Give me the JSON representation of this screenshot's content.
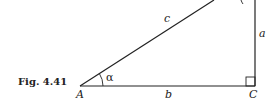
{
  "figure": {
    "caption": "Fig. 4.41",
    "vertices": {
      "A": "A",
      "C": "C"
    },
    "sides": {
      "a": "a",
      "b": "b",
      "c": "c"
    },
    "angles": {
      "alpha": "α"
    },
    "right_angle_at": "C"
  }
}
